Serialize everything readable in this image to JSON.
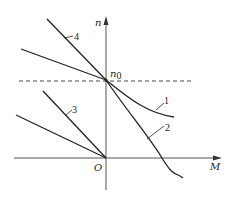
{
  "diagram": {
    "type": "motor mechanical characteristics",
    "axes": {
      "y_label": "n",
      "x_label": "M",
      "origin_label": "O"
    },
    "reference": {
      "label": "n",
      "subscript": "0",
      "description": "no-load speed dashed line"
    },
    "curves": [
      {
        "id": "1",
        "label": "1"
      },
      {
        "id": "2",
        "label": "2"
      },
      {
        "id": "3",
        "label": "3"
      },
      {
        "id": "4",
        "label": "4"
      }
    ]
  }
}
